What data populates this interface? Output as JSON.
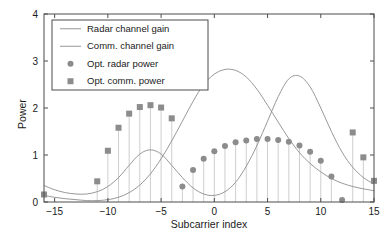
{
  "chart_data": {
    "type": "line",
    "title": "",
    "xlabel": "Subcarrier index",
    "ylabel": "Power",
    "xlim": [
      -16,
      15
    ],
    "ylim": [
      0,
      4
    ],
    "xticks": [
      -15,
      -10,
      -5,
      0,
      5,
      10,
      15
    ],
    "xtick_labels": [
      "−15",
      "−10",
      "−5",
      "0",
      "5",
      "10",
      "15"
    ],
    "yticks": [
      0,
      1,
      2,
      3,
      4
    ],
    "ytick_labels": [
      "0",
      "1",
      "2",
      "3",
      "4"
    ],
    "grid": false,
    "legend_position": "upper left",
    "colors": {
      "radar_gain_line": "#8c8c8c",
      "comm_gain_line": "#8c8c8c",
      "radar_marker": "#8c8c8c",
      "comm_marker": "#8c8c8c",
      "stem": "#c8c8c8",
      "axis": "#4d4d4d",
      "text": "#1a1a1a"
    },
    "series": [
      {
        "name": "Radar channel gain",
        "type": "line",
        "marker": "none",
        "x": [
          -16,
          -15,
          -14,
          -13,
          -12,
          -11,
          -10,
          -9,
          -8,
          -7,
          -6,
          -5,
          -4,
          -3,
          -2,
          -1,
          0,
          1,
          2,
          3,
          4,
          5,
          6,
          7,
          8,
          9,
          10,
          11,
          12,
          13,
          14,
          15
        ],
        "values": [
          0.35,
          0.26,
          0.2,
          0.17,
          0.17,
          0.22,
          0.33,
          0.52,
          0.78,
          1.02,
          1.11,
          1.02,
          0.78,
          0.52,
          0.3,
          0.17,
          0.14,
          0.22,
          0.42,
          0.76,
          1.2,
          1.72,
          2.24,
          2.62,
          2.68,
          2.45,
          2.0,
          1.5,
          1.06,
          0.74,
          0.52,
          0.38
        ]
      },
      {
        "name": "Comm. channel gain",
        "type": "line",
        "marker": "none",
        "x": [
          -16,
          -15,
          -14,
          -13,
          -12,
          -11,
          -10,
          -9,
          -8,
          -7,
          -6,
          -5,
          -4,
          -3,
          -2,
          -1,
          0,
          1,
          2,
          3,
          4,
          5,
          6,
          7,
          8,
          9,
          10,
          11,
          12,
          13,
          14,
          15
        ],
        "values": [
          0.14,
          0.1,
          0.07,
          0.05,
          0.03,
          0.03,
          0.05,
          0.1,
          0.2,
          0.36,
          0.6,
          0.92,
          1.3,
          1.72,
          2.14,
          2.5,
          2.72,
          2.82,
          2.8,
          2.66,
          2.4,
          2.06,
          1.7,
          1.35,
          1.05,
          0.82,
          0.64,
          0.5,
          0.4,
          0.33,
          0.28,
          0.24
        ]
      },
      {
        "name": "Opt. radar power",
        "type": "stem",
        "marker": "circle",
        "x": [
          -3,
          -2,
          -1,
          0,
          1,
          2,
          3,
          4,
          5,
          6,
          7,
          8,
          9,
          10,
          11,
          12
        ],
        "values": [
          0.33,
          0.68,
          0.92,
          1.08,
          1.19,
          1.27,
          1.31,
          1.34,
          1.34,
          1.32,
          1.28,
          1.2,
          1.07,
          0.88,
          0.54,
          0.04
        ]
      },
      {
        "name": "Opt. comm. power",
        "type": "stem",
        "marker": "square",
        "x": [
          -16,
          -11,
          -10,
          -9,
          -8,
          -7,
          -6,
          -5,
          -4,
          13,
          14,
          15
        ],
        "values": [
          0.16,
          0.44,
          1.09,
          1.58,
          1.88,
          2.02,
          2.06,
          2.01,
          1.78,
          1.48,
          0.95,
          0.45
        ]
      }
    ],
    "legend": [
      {
        "label": "Radar channel gain",
        "marker": "line",
        "color": "#8c8c8c"
      },
      {
        "label": "Comm. channel gain",
        "marker": "line",
        "color": "#8c8c8c"
      },
      {
        "label": "Opt. radar power",
        "marker": "circle",
        "color": "#8c8c8c"
      },
      {
        "label": "Opt. comm. power",
        "marker": "square",
        "color": "#8c8c8c"
      }
    ]
  }
}
